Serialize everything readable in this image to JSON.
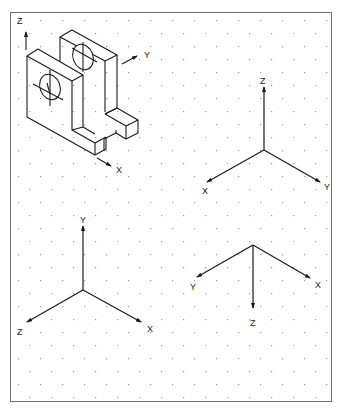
{
  "figure": {
    "border_color": "#6e6e6e",
    "line_color": "#1a1a1a",
    "dot_color": "#9a9a9a"
  },
  "part": {
    "name": "bracket-with-two-holed-plates",
    "axes": {
      "z_label": "Z",
      "y_label": "Y",
      "x_label": "X"
    }
  },
  "triads": [
    {
      "id": "triad-top-right",
      "origin": "Z up, X lower-left, Y lower-right",
      "labels": {
        "z": "Z",
        "x": "X",
        "y": "Y"
      }
    },
    {
      "id": "triad-bottom-left",
      "origin": "Y up, Z lower-left, X lower-right",
      "labels": {
        "y": "Y",
        "z": "Z",
        "x": "X"
      }
    },
    {
      "id": "triad-bottom-right",
      "origin": "Z down, Y lower-left, X lower-right",
      "labels": {
        "y": "Y",
        "x": "X",
        "z": "Z"
      }
    }
  ]
}
